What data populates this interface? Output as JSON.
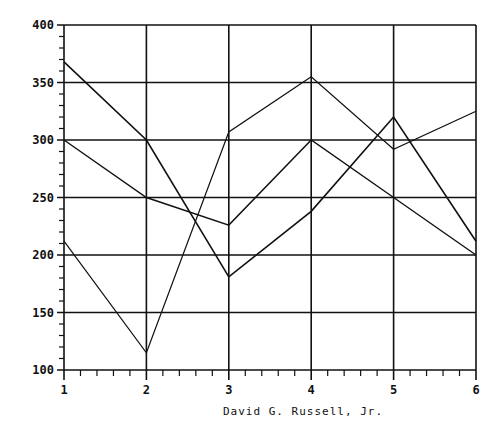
{
  "chart_data": {
    "type": "line",
    "title": "",
    "xlabel": "",
    "ylabel": "",
    "caption": "David G. Russell, Jr.",
    "x": [
      1,
      2,
      3,
      4,
      5,
      6
    ],
    "xticks": [
      "1",
      "2",
      "3",
      "4",
      "5",
      "6"
    ],
    "yticks": [
      "100",
      "150",
      "200",
      "250",
      "300",
      "350",
      "400"
    ],
    "ylim": [
      100,
      400
    ],
    "xlim": [
      1,
      6
    ],
    "grid": true,
    "legend": "none",
    "series": [
      {
        "name": "Series 1",
        "values": [
          212,
          115,
          307,
          355,
          292,
          325
        ],
        "weight": 1.2
      },
      {
        "name": "Series 2",
        "values": [
          368,
          300,
          181,
          238,
          320,
          212
        ],
        "weight": 1.6
      },
      {
        "name": "Series 3",
        "values": [
          300,
          250,
          226,
          300,
          250,
          200
        ],
        "weight": 1.4
      }
    ],
    "colors": {
      "line": "#111111",
      "grid": "#111111",
      "background": "#ffffff"
    }
  }
}
